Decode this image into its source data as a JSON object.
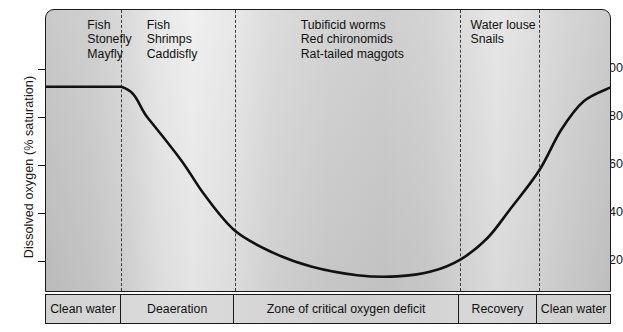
{
  "chart_data": {
    "type": "line",
    "title": "",
    "xlabel": "",
    "ylabel": "Dissolved oxygen (% saturation)",
    "ylim": [
      0,
      108
    ],
    "yticks": [
      20,
      40,
      60,
      80,
      100
    ],
    "grid": false,
    "legend": "none",
    "x_zones": [
      {
        "label": "Clean water",
        "start": 0,
        "end": 13.3
      },
      {
        "label": "Deaeration",
        "start": 13.3,
        "end": 33.4
      },
      {
        "label": "Zone of critical oxygen deficit",
        "start": 33.4,
        "end": 73.2
      },
      {
        "label": "Recovery",
        "start": 73.2,
        "end": 87.1
      },
      {
        "label": "Clean water",
        "start": 87.1,
        "end": 100
      }
    ],
    "series": [
      {
        "name": "Dissolved oxygen",
        "x": [
          0,
          13.3,
          18,
          24,
          28,
          33.4,
          40,
          47,
          55,
          62,
          68,
          73.2,
          78,
          82,
          87.1,
          91,
          95,
          100
        ],
        "values": [
          93,
          93,
          80,
          62,
          48,
          33,
          24,
          18,
          14.5,
          14,
          16,
          21,
          30,
          42,
          58,
          75,
          87,
          93
        ]
      }
    ],
    "dividers_x": [
      13.3,
      33.4,
      73.2,
      87.1
    ],
    "annotations": [
      {
        "name": "clean-water-species",
        "x": 13.5,
        "lines": [
          "Fish",
          "Stonefly",
          "Mayfly"
        ]
      },
      {
        "name": "deaeration-species",
        "x": 33.5,
        "lines": [
          "Fish",
          "Shrimps",
          "Caddisfly"
        ]
      },
      {
        "name": "critical-deficit-species",
        "x": 73.5,
        "lines": [
          "Tubificid worms",
          "Red chironomids",
          "Rat-tailed maggots"
        ]
      },
      {
        "name": "recovery-species",
        "x": 87.2,
        "lines": [
          "Water louse",
          "Snails"
        ]
      }
    ]
  },
  "axis": {
    "y_title": "Dissolved oxygen (% saturation)",
    "ticks": [
      {
        "value": "100",
        "top": 69
      },
      {
        "value": "80",
        "top": 117
      },
      {
        "value": "60",
        "top": 165
      },
      {
        "value": "40",
        "top": 213
      },
      {
        "value": "20",
        "top": 261
      }
    ]
  },
  "zones": [
    {
      "label": "Clean water",
      "width": 13.3
    },
    {
      "label": "Deaeration",
      "width": 20.1
    },
    {
      "label": "Zone of critical oxygen deficit",
      "width": 39.8
    },
    {
      "label": "Recovery",
      "width": 13.9
    },
    {
      "label": "Clean water",
      "width": 12.9
    }
  ],
  "species": [
    {
      "name": "clean-water-species",
      "left": 7.3,
      "lines": [
        "Fish",
        "Stonefly",
        "Mayfly"
      ]
    },
    {
      "name": "deaeration-species",
      "left": 17.8,
      "lines": [
        "Fish",
        "Shrimps",
        "Caddisfly"
      ]
    },
    {
      "name": "critical-deficit-species",
      "left": 45.0,
      "lines": [
        "Tubificid worms",
        "Red chironomids",
        "Rat-tailed maggots"
      ]
    },
    {
      "name": "recovery-species",
      "left": 75.0,
      "lines": [
        "Water louse",
        "Snails"
      ]
    }
  ],
  "colors": {
    "line": "#111111",
    "frame": "#1a1a1a",
    "divider": "#3a3a3a",
    "text": "#111111"
  }
}
